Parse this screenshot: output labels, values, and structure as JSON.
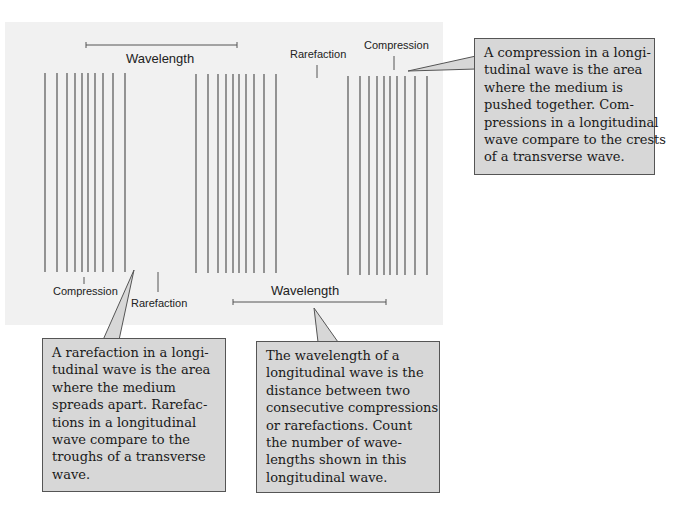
{
  "diagram": {
    "type": "longitudinal-wave",
    "background_color": "#f1f1f1",
    "callout_fill": "#d7d7d7",
    "callout_border": "#555555",
    "labels": {
      "wavelength_top": "Wavelength",
      "rarefaction_top": "Rarefaction",
      "compression_top": "Compression",
      "compression_bottom": "Compression",
      "rarefaction_bottom": "Rarefaction",
      "wavelength_bottom": "Wavelength"
    },
    "line_groups": [
      {
        "x": [
          45,
          57,
          67,
          75,
          82,
          88,
          95,
          103,
          113,
          125
        ],
        "y_top": 73,
        "y_bottom": 272
      },
      {
        "x": [
          196,
          208,
          218,
          226,
          233,
          239,
          246,
          254,
          264,
          276
        ],
        "y_top": 74,
        "y_bottom": 273
      },
      {
        "x": [
          348,
          360,
          369,
          377,
          384,
          390,
          397,
          405,
          415,
          427
        ],
        "y_top": 76,
        "y_bottom": 275
      }
    ]
  },
  "callouts": {
    "compression": {
      "lines": [
        "A compression in a longi-",
        "tudinal wave is the area",
        "where the medium is",
        "pushed together. Com-",
        "pressions in a longitudinal",
        "wave compare to the crests",
        "of a transverse wave."
      ]
    },
    "rarefaction": {
      "lines": [
        "A rarefaction in a longi-",
        "tudinal wave is the area",
        "where the medium",
        "spreads apart. Rarefac-",
        "tions in a longitudinal",
        "wave compare to the",
        "troughs of a transverse",
        "wave."
      ]
    },
    "wavelength": {
      "lines": [
        "The wavelength of a",
        "longitudinal wave is the",
        "distance between two",
        "consecutive compressions",
        "or rarefactions. Count",
        "the number of wave-",
        "lengths shown in this",
        "longitudinal wave."
      ]
    }
  }
}
